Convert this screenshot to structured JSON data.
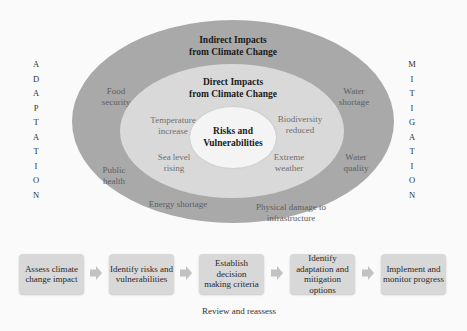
{
  "diagram": {
    "side_labels": {
      "left": "ADAPTATION",
      "right": "MITIGATION"
    },
    "rings": {
      "outer": {
        "title_line1": "Indirect Impacts",
        "title_line2": "from Climate Change",
        "items": [
          {
            "line1": "Food",
            "line2": "security"
          },
          {
            "line1": "Water",
            "line2": "shortage"
          },
          {
            "line1": "Public",
            "line2": "health"
          },
          {
            "line1": "Water",
            "line2": "quality"
          },
          {
            "line1": "Energy shortage",
            "line2": ""
          },
          {
            "line1": "Physical damage to",
            "line2": "infrastructure"
          }
        ]
      },
      "middle": {
        "title_line1": "Direct Impacts",
        "title_line2": "from Climate Change",
        "items": [
          {
            "line1": "Temperature",
            "line2": "increase"
          },
          {
            "line1": "Biodiversity",
            "line2": "reduced"
          },
          {
            "line1": "Sea level",
            "line2": "rising"
          },
          {
            "line1": "Extreme",
            "line2": "weather"
          }
        ]
      },
      "inner": {
        "title_line1": "Risks and",
        "title_line2": "Vulnerabilities"
      }
    },
    "colors": {
      "outer": "#a9a9a9",
      "middle": "#d9d9d9",
      "inner": "#f4f4f4",
      "box": "#d8d8d8",
      "arrow": "#c2c2c2"
    },
    "process": {
      "steps": [
        {
          "line1": "Assess climate",
          "line2": "change impact"
        },
        {
          "line1": "Identify risks and",
          "line2": "vulnerabilities"
        },
        {
          "line1": "Establish decision",
          "line2": "making criteria"
        },
        {
          "line1": "Identify",
          "line2": "adaptation and",
          "line3": "mitigation options"
        },
        {
          "line1": "Implement and",
          "line2": "monitor progress"
        }
      ],
      "loop_label": "Review and reassess"
    }
  }
}
